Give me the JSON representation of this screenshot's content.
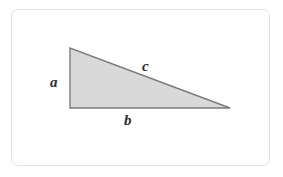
{
  "figure": {
    "name": "right-triangle-diagram",
    "background_color": "#ffffff",
    "frame": {
      "border_color": "#e2e2e2",
      "radius_px": 7
    },
    "shape": {
      "type": "right-triangle",
      "fill_color": "#d9d9d9",
      "stroke_color": "#7a7a7a",
      "stroke_width_px": 1.4,
      "vertices": {
        "apex_top_left": [
          70,
          48
        ],
        "corner_bottom_left": [
          70,
          108
        ],
        "corner_bottom_right": [
          230,
          108
        ]
      },
      "right_angle_at": "corner_bottom_left"
    },
    "labels": {
      "vertical_leg": "a",
      "horizontal_leg": "b",
      "hypotenuse": "c"
    }
  },
  "chart_data": {
    "type": "diagram",
    "title": "",
    "shape": "right triangle",
    "annotations": [
      {
        "text": "a",
        "side": "vertical-leg",
        "x": 55,
        "y": 82
      },
      {
        "text": "c",
        "side": "hypotenuse",
        "x": 147,
        "y": 66
      },
      {
        "text": "b",
        "side": "horizontal-leg",
        "x": 129,
        "y": 121
      }
    ],
    "points": [
      {
        "label": "apex",
        "x": 70,
        "y": 48
      },
      {
        "label": "right-angle",
        "x": 70,
        "y": 108
      },
      {
        "label": "far-right",
        "x": 230,
        "y": 108
      }
    ]
  }
}
